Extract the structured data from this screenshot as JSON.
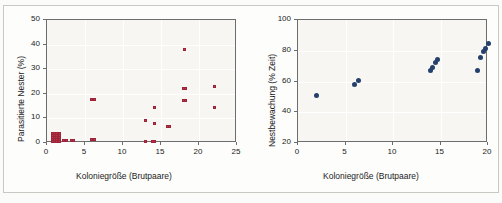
{
  "figure": {
    "background_color": "#fbfbf9",
    "panel_bg_color": "#f7f6f2",
    "left_marker_color": "#c2374b",
    "right_marker_color": "#24406b"
  },
  "chart_data": [
    {
      "type": "scatter",
      "id": "left",
      "title": "",
      "xlabel": "Koloniegröße (Brutpaare)",
      "ylabel": "Parasitierte Nester (%)",
      "xlim": [
        0,
        25
      ],
      "ylim": [
        0,
        50
      ],
      "xticks": [
        0,
        5,
        10,
        15,
        20,
        25
      ],
      "yticks": [
        0,
        10,
        20,
        30,
        40,
        50
      ],
      "grid": true,
      "legend": "none",
      "marker": "square",
      "marker_color": "#c2374b",
      "points": [
        {
          "x": 0.7,
          "y": 0.5
        },
        {
          "x": 0.7,
          "y": 1.3
        },
        {
          "x": 0.7,
          "y": 2.1
        },
        {
          "x": 0.7,
          "y": 2.9
        },
        {
          "x": 0.7,
          "y": 3.7
        },
        {
          "x": 1.0,
          "y": 0.5
        },
        {
          "x": 1.0,
          "y": 1.3
        },
        {
          "x": 1.0,
          "y": 2.1
        },
        {
          "x": 1.0,
          "y": 2.9
        },
        {
          "x": 1.0,
          "y": 3.7
        },
        {
          "x": 1.3,
          "y": 0.5
        },
        {
          "x": 1.3,
          "y": 1.3
        },
        {
          "x": 1.3,
          "y": 2.1
        },
        {
          "x": 1.3,
          "y": 2.9
        },
        {
          "x": 1.3,
          "y": 3.7
        },
        {
          "x": 1.6,
          "y": 0.5
        },
        {
          "x": 1.6,
          "y": 1.3
        },
        {
          "x": 1.6,
          "y": 2.1
        },
        {
          "x": 1.6,
          "y": 2.9
        },
        {
          "x": 1.6,
          "y": 3.7
        },
        {
          "x": 2.2,
          "y": 1.2
        },
        {
          "x": 2.6,
          "y": 1.2
        },
        {
          "x": 3.2,
          "y": 1.2
        },
        {
          "x": 3.5,
          "y": 1.2
        },
        {
          "x": 5.9,
          "y": 1.4
        },
        {
          "x": 6.2,
          "y": 1.4
        },
        {
          "x": 5.9,
          "y": 17.8
        },
        {
          "x": 6.2,
          "y": 17.8
        },
        {
          "x": 12.9,
          "y": 0.5
        },
        {
          "x": 12.9,
          "y": 9.0
        },
        {
          "x": 13.9,
          "y": 0.5
        },
        {
          "x": 14.2,
          "y": 0.5
        },
        {
          "x": 14.1,
          "y": 7.8
        },
        {
          "x": 14.2,
          "y": 14.5
        },
        {
          "x": 15.9,
          "y": 6.7
        },
        {
          "x": 16.1,
          "y": 6.7
        },
        {
          "x": 17.9,
          "y": 17.2
        },
        {
          "x": 18.2,
          "y": 17.2
        },
        {
          "x": 17.9,
          "y": 22.0
        },
        {
          "x": 18.2,
          "y": 22.0
        },
        {
          "x": 18.1,
          "y": 38.0
        },
        {
          "x": 22.0,
          "y": 14.3
        },
        {
          "x": 22.0,
          "y": 22.8
        }
      ]
    },
    {
      "type": "scatter",
      "id": "right",
      "title": "",
      "xlabel": "Koloniegröße (Brutpaare)",
      "ylabel": "Nestbewachung (% Zeit)",
      "xlim": [
        0,
        20
      ],
      "ylim": [
        20,
        100
      ],
      "xticks": [
        0,
        5,
        10,
        15,
        20
      ],
      "yticks": [
        20,
        40,
        60,
        80,
        100
      ],
      "grid": true,
      "legend": "none",
      "marker": "circle",
      "marker_color": "#24406b",
      "points": [
        {
          "x": 1.9,
          "y": 51.0
        },
        {
          "x": 5.9,
          "y": 58.2
        },
        {
          "x": 6.4,
          "y": 60.5
        },
        {
          "x": 13.9,
          "y": 67.0
        },
        {
          "x": 14.2,
          "y": 68.8
        },
        {
          "x": 14.5,
          "y": 72.6
        },
        {
          "x": 14.7,
          "y": 74.0
        },
        {
          "x": 18.9,
          "y": 67.3
        },
        {
          "x": 19.2,
          "y": 75.8
        },
        {
          "x": 19.5,
          "y": 79.5
        },
        {
          "x": 19.7,
          "y": 81.5
        },
        {
          "x": 20.0,
          "y": 84.5
        }
      ]
    }
  ]
}
